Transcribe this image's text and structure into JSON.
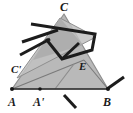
{
  "figure": {
    "kind": "geometry-diagram",
    "background_color": "#ffffff",
    "colors": {
      "triangle_fill": "#b9b9b9",
      "triangle_fill_secondary": "#c9c9c9",
      "triangle_overlap_fill": "#a6a6a6",
      "triangle_stroke": "#8f8f8f",
      "thick_stroke": "#1c1c1c",
      "thin_stroke": "#7a7a7a",
      "label_color": "#1a1a1a",
      "point_color": "#171717"
    },
    "stroke_widths": {
      "thick": 3.0,
      "thin": 1.1,
      "triangle_outline": 1.2
    }
  },
  "shapes": {
    "main_triangle": {
      "name": "triangle-ABC",
      "points": "12,89 108,89 64,14",
      "fill": "#b9b9b9",
      "stroke": "#8f8f8f"
    },
    "rotated_triangle": {
      "name": "triangle-A-prime-B-C-prime",
      "points": "17,78 96,37 60,18",
      "fill": "#c1c1c1",
      "stroke": "#8f8f8f"
    },
    "overlap_triangle": {
      "name": "triangle-overlap-region",
      "points": "33,60 60,18 83,45",
      "fill": "#a8a8a8",
      "stroke": "none"
    }
  },
  "segments": {
    "baseline": {
      "name": "segment-AB",
      "x1": 12,
      "y1": 89,
      "x2": 108,
      "y2": 89
    },
    "thin_cevian_one": {
      "name": "segment-A-to-E",
      "x1": 12,
      "y1": 89,
      "x2": 84,
      "y2": 60
    },
    "thin_cevian_two": {
      "name": "segment-E-to-B",
      "x1": 84,
      "y1": 60,
      "x2": 108,
      "y2": 89
    },
    "thin_fold_line": {
      "name": "segment-fold-dashed",
      "x1": 55,
      "y1": 89,
      "x2": 74,
      "y2": 64
    },
    "thick_polyline_main": {
      "name": "polyline-folded-strip",
      "points": "31,24 95,34 92,50 62,59 46,39"
    },
    "thick_left_upper": {
      "name": "segment-thick-left-upper",
      "x1": 22,
      "y1": 42,
      "x2": 58,
      "y2": 30
    },
    "thick_left_lower": {
      "name": "segment-thick-left-lower",
      "x1": 20,
      "y1": 55,
      "x2": 50,
      "y2": 39
    },
    "thick_inner_right": {
      "name": "segment-thick-inner-right",
      "x1": 79,
      "y1": 43,
      "x2": 62,
      "y2": 59
    },
    "thick_at_B": {
      "name": "segment-thick-at-B",
      "x1": 107,
      "y1": 89,
      "x2": 124,
      "y2": 77
    },
    "thick_below_base": {
      "name": "segment-thick-below-baseline",
      "x1": 64,
      "y1": 95,
      "x2": 76,
      "y2": 108
    }
  },
  "points": [
    {
      "name": "point-A",
      "label": "A",
      "x": 12,
      "y": 89,
      "label_x": 8,
      "label_y": 104,
      "dot": true
    },
    {
      "name": "point-A-prime",
      "label": "A'",
      "x": 40,
      "y": 89,
      "label_x": 33,
      "label_y": 104,
      "dot": true
    },
    {
      "name": "point-B",
      "label": "B",
      "x": 108,
      "y": 89,
      "label_x": 103,
      "label_y": 104,
      "dot": true
    },
    {
      "name": "point-C",
      "label": "C",
      "x": 64,
      "y": 14,
      "label_x": 60,
      "label_y": 10,
      "dot": false
    },
    {
      "name": "point-C-prime",
      "label": "C'",
      "x": 19,
      "y": 70,
      "label_x": 12,
      "label_y": 70,
      "dot": false
    },
    {
      "name": "point-E",
      "label": "E",
      "x": 84,
      "y": 60,
      "label_x": 80,
      "label_y": 69,
      "dot": false
    }
  ],
  "labels": {
    "A": "A",
    "A_prime": "A'",
    "B": "B",
    "C": "C",
    "C_prime": "C'",
    "E": "E"
  }
}
